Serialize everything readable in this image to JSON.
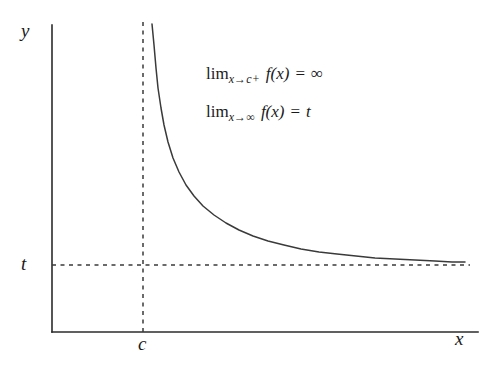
{
  "figure": {
    "kind": "function-graph",
    "background_color": "#ffffff",
    "ink_color": "#2b2b2b",
    "axes": {
      "y_axis_label": "y",
      "x_axis_label": "x",
      "y_tick_label": "t",
      "x_tick_label": "c"
    },
    "annotations": {
      "limit_1": {
        "operator": "lim",
        "subscript_variable": "x",
        "arrow": "→",
        "subscript_target": "c+",
        "function": "f(x)",
        "equals": "=",
        "value": "∞",
        "plain_text": "lim_{x→c+} f(x) = ∞"
      },
      "limit_2": {
        "operator": "lim",
        "subscript_variable": "x",
        "arrow": "→",
        "subscript_target": "∞",
        "function": "f(x)",
        "equals": "=",
        "value": "t",
        "plain_text": "lim_{x→∞} f(x) = t"
      }
    }
  },
  "chart_data": {
    "type": "line",
    "title": "",
    "xlabel": "x",
    "ylabel": "y",
    "grid": false,
    "legend": null,
    "xlim": [
      52,
      478
    ],
    "ylim": [
      332,
      25
    ],
    "asymptotes": [
      {
        "name": "vertical-asymptote",
        "orientation": "vertical",
        "value_label": "c",
        "x_px": 143,
        "y_start_px": 22,
        "y_end_px": 332,
        "style": "dashed"
      },
      {
        "name": "horizontal-asymptote",
        "orientation": "horizontal",
        "value_label": "t",
        "y_px": 265,
        "x_start_px": 52,
        "x_end_px": 470,
        "style": "dashed"
      }
    ],
    "series": [
      {
        "name": "f(x)",
        "description": "decreasing hyperbolic branch rising to infinity at x=c and decaying to y=t as x grows",
        "points_px": [
          [
            152,
            24
          ],
          [
            154,
            45
          ],
          [
            156,
            68
          ],
          [
            158,
            88
          ],
          [
            161,
            108
          ],
          [
            164,
            125
          ],
          [
            168,
            142
          ],
          [
            173,
            158
          ],
          [
            179,
            172
          ],
          [
            186,
            185
          ],
          [
            194,
            196
          ],
          [
            203,
            206
          ],
          [
            214,
            215
          ],
          [
            226,
            223
          ],
          [
            239,
            230
          ],
          [
            253,
            236
          ],
          [
            268,
            241
          ],
          [
            284,
            245
          ],
          [
            301,
            249
          ],
          [
            319,
            252
          ],
          [
            337,
            254
          ],
          [
            356,
            256
          ],
          [
            375,
            258
          ],
          [
            395,
            259
          ],
          [
            415,
            260
          ],
          [
            435,
            261
          ],
          [
            452,
            262
          ],
          [
            465,
            262
          ]
        ]
      }
    ],
    "axis_lines": {
      "y_axis": {
        "x_px": 52,
        "y_top_px": 25,
        "y_bottom_px": 332
      },
      "x_axis": {
        "y_px": 332,
        "x_left_px": 52,
        "x_right_px": 478
      }
    }
  }
}
